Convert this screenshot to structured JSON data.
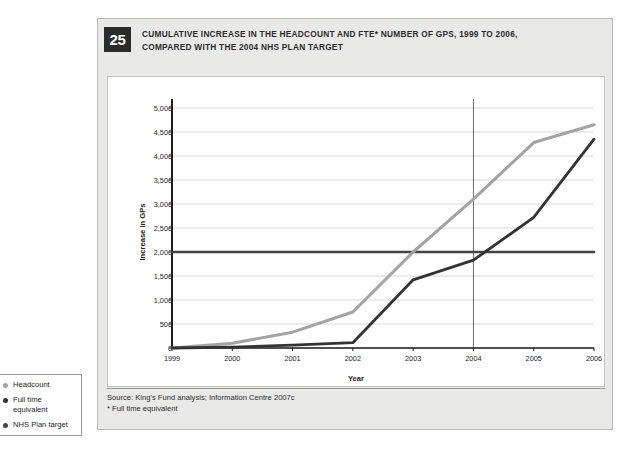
{
  "figure": {
    "number": "25",
    "title_line1": "CUMULATIVE INCREASE IN THE HEADCOUNT AND FTE* NUMBER OF GPs, 1999 TO 2006,",
    "title_line2": "COMPARED WITH THE 2004 NHS PLAN TARGET",
    "source_line1": "Source: King's Fund analysis; Information Centre 2007c",
    "source_line2": "* Full time equivalent"
  },
  "legend": {
    "items": [
      {
        "label": "Headcount",
        "color": "#a3a3a3"
      },
      {
        "label": "Full time\nequivalent",
        "color": "#333333"
      },
      {
        "label": "NHS Plan target",
        "color": "#444444"
      }
    ]
  },
  "colors": {
    "headcount": "#a3a3a3",
    "fte": "#333333",
    "target": "#444444",
    "grid": "#d8d8d8",
    "axis": "#1d1d1d",
    "panel_bg": "#e9e9e7",
    "badge_bg": "#2b2b2b"
  },
  "chart_data": {
    "type": "line",
    "title": "CUMULATIVE INCREASE IN THE HEADCOUNT AND FTE* NUMBER OF GPs, 1999 TO 2006, COMPARED WITH THE 2004 NHS PLAN TARGET",
    "xlabel": "Year",
    "ylabel": "Increase in GPs",
    "x": [
      1999,
      2000,
      2001,
      2002,
      2003,
      2004,
      2005,
      2006
    ],
    "xticklabels": [
      "1999",
      "2000",
      "2001",
      "2002",
      "2003",
      "2004",
      "2005",
      "2006"
    ],
    "yticks": [
      0,
      500,
      1000,
      1500,
      2000,
      2500,
      3000,
      3500,
      4000,
      4500,
      5000
    ],
    "yticklabels": [
      "0",
      "500",
      "1,000",
      "1,500",
      "2,000",
      "2,500",
      "3,000",
      "3,500",
      "4,000",
      "4,500",
      "5,000"
    ],
    "ylim": [
      0,
      5000
    ],
    "xlim": [
      1999,
      2006
    ],
    "grid": true,
    "legend_position": "outside-left",
    "series": [
      {
        "name": "Headcount",
        "color": "#a3a3a3",
        "values": [
          0,
          100,
          330,
          750,
          2000,
          3100,
          4280,
          4650
        ]
      },
      {
        "name": "Full time equivalent",
        "color": "#333333",
        "values": [
          0,
          20,
          60,
          110,
          1420,
          1830,
          2720,
          4350
        ]
      },
      {
        "name": "NHS Plan target",
        "color": "#444444",
        "values": [
          2000,
          2000,
          2000,
          2000,
          2000,
          2000,
          2000,
          2000
        ]
      }
    ],
    "annotations": [
      {
        "type": "vertical-line",
        "x": 2004,
        "label": "2004 NHS Plan target year"
      }
    ]
  }
}
